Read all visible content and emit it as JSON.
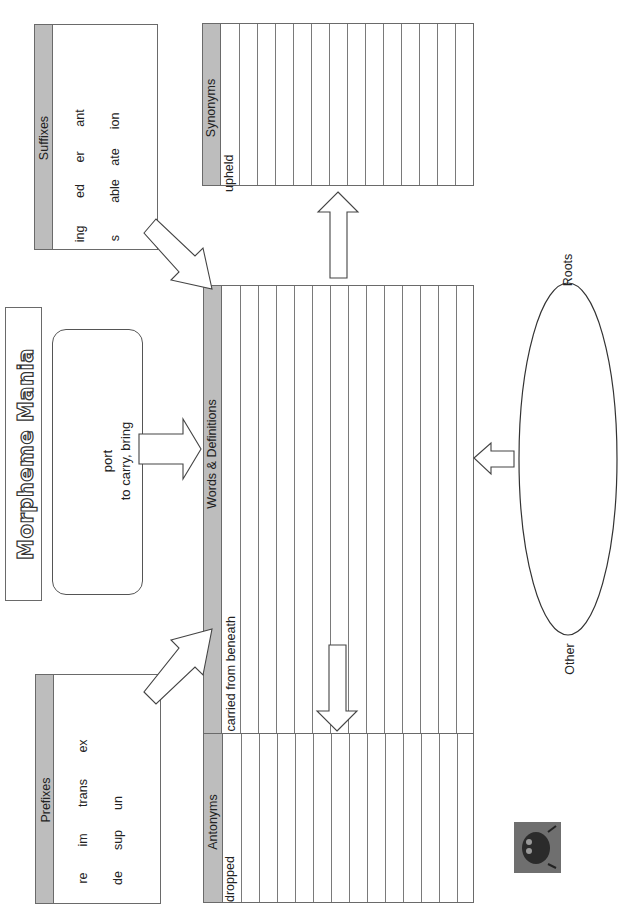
{
  "page": {
    "title": "Morpheme Mania",
    "orientation": "rotated 90° counter-clockwise"
  },
  "root_box": {
    "root": "port",
    "meaning": "to carry, bring"
  },
  "prefixes": {
    "header": "Prefixes",
    "row1": [
      "re",
      "im",
      "trans",
      "ex"
    ],
    "row2": [
      "de",
      "sup",
      "un"
    ]
  },
  "suffixes": {
    "header": "Suffixes",
    "row1": [
      "ing",
      "ed",
      "er",
      "ant"
    ],
    "row2": [
      "s",
      "able",
      "ate",
      "ion"
    ]
  },
  "words_definitions": {
    "header": "Words & Definitions",
    "entries": [
      "supported – carried from beneath"
    ],
    "line_count": 15
  },
  "synonyms": {
    "header": "Synonyms",
    "entries": [
      "upheld"
    ],
    "line_count": 15
  },
  "antonyms": {
    "header": "Antonyms",
    "entries": [
      "dropped"
    ],
    "line_count": 15
  },
  "ellipse": {
    "label_top": "Roots",
    "label_bottom": "Other"
  },
  "colors": {
    "header_strip": "#bdbdbd",
    "border": "#6a6a6a",
    "background": "#ffffff"
  }
}
